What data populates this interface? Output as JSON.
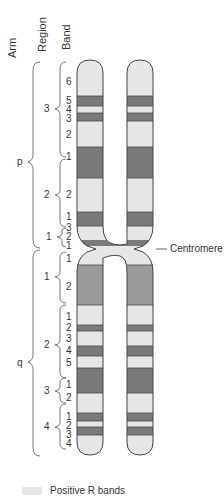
{
  "headers": {
    "arm": "Arm",
    "region": "Region",
    "band": "Band"
  },
  "centromere_label": "Centromere",
  "legend": {
    "label": "Positive R bands",
    "color": "#e6e6e6"
  },
  "colors": {
    "light": "#e6e6e6",
    "dark": "#7a7a7a",
    "medium": "#9a9a9a",
    "outline": "#444444"
  },
  "arms": [
    {
      "name": "p",
      "regions": [
        {
          "name": "3",
          "bands": [
            "6",
            "5",
            "4",
            "3",
            "2",
            "1"
          ]
        },
        {
          "name": "2",
          "bands": [
            "2",
            "1"
          ]
        },
        {
          "name": "1",
          "bands": [
            "3",
            "2",
            "1"
          ]
        }
      ]
    },
    {
      "name": "q",
      "regions": [
        {
          "name": "1",
          "bands": [
            "1",
            "2"
          ]
        },
        {
          "name": "2",
          "bands": [
            "1",
            "2",
            "3",
            "4",
            "5"
          ]
        },
        {
          "name": "3",
          "bands": [
            "1",
            "2"
          ]
        },
        {
          "name": "4",
          "bands": [
            "1",
            "2",
            "3",
            "4"
          ]
        }
      ]
    }
  ]
}
